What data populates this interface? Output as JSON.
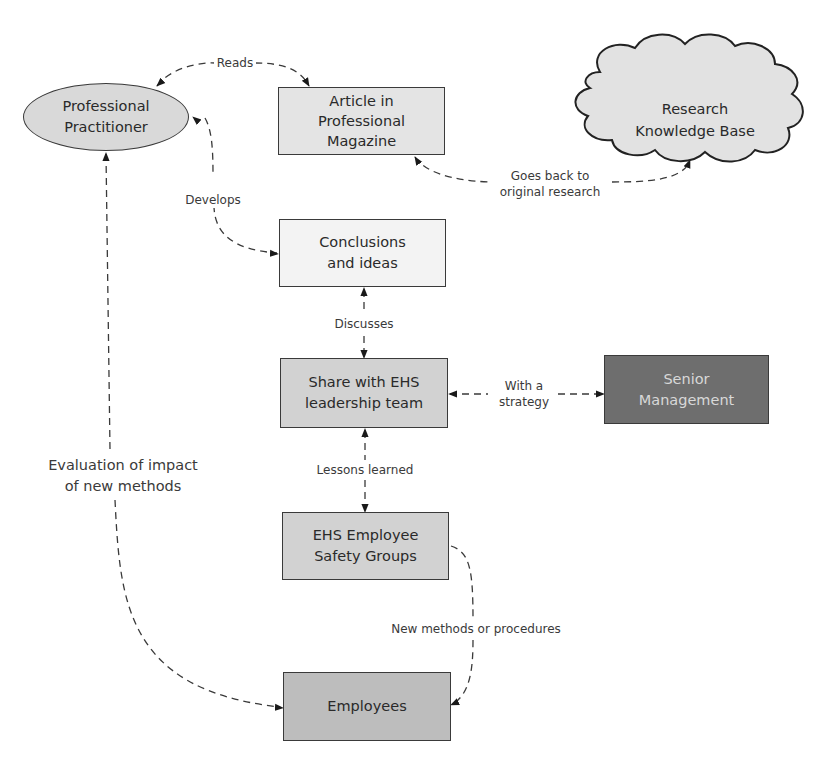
{
  "diagram": {
    "nodes": {
      "practitioner": {
        "label": "Professional\nPractitioner",
        "shape": "ellipse",
        "fill": "#d9d9d9"
      },
      "article": {
        "label": "Article in\nProfessional\nMagazine",
        "shape": "rectangle",
        "fill": "#e4e4e4"
      },
      "research": {
        "label": "Research\nKnowledge Base",
        "shape": "cloud",
        "fill": "#e2e2e2"
      },
      "conclusions": {
        "label": "Conclusions\nand ideas",
        "shape": "rectangle",
        "fill": "#f3f3f3"
      },
      "share": {
        "label": "Share with EHS\nleadership team",
        "shape": "rectangle",
        "fill": "#d2d2d2"
      },
      "senior": {
        "label": "Senior\nManagement",
        "shape": "rectangle",
        "fill": "#6e6e6e"
      },
      "safety_groups": {
        "label": "EHS Employee\nSafety Groups",
        "shape": "rectangle",
        "fill": "#d2d2d2"
      },
      "employees": {
        "label": "Employees",
        "shape": "rectangle",
        "fill": "#bdbdbd"
      }
    },
    "edges": [
      {
        "from": "practitioner",
        "to": "article",
        "label": "Reads",
        "style": "dashed",
        "arrows": "both"
      },
      {
        "from": "article",
        "to": "research",
        "label": "Goes back to\noriginal research",
        "style": "dashed",
        "arrows": "both"
      },
      {
        "from": "practitioner",
        "to": "conclusions",
        "label": "Develops",
        "style": "dashed",
        "arrows": "both"
      },
      {
        "from": "conclusions",
        "to": "share",
        "label": "Discusses",
        "style": "dashed",
        "arrows": "both"
      },
      {
        "from": "share",
        "to": "senior",
        "label": "With a\nstrategy",
        "style": "dashed",
        "arrows": "both"
      },
      {
        "from": "share",
        "to": "safety_groups",
        "label": "Lessons learned",
        "style": "dashed",
        "arrows": "both"
      },
      {
        "from": "safety_groups",
        "to": "employees",
        "label": "New methods or procedures",
        "style": "dashed",
        "arrows": "to"
      },
      {
        "from": "employees",
        "to": "practitioner",
        "label": "Evaluation of impact\nof new methods",
        "style": "dashed",
        "arrows": "both"
      }
    ]
  }
}
